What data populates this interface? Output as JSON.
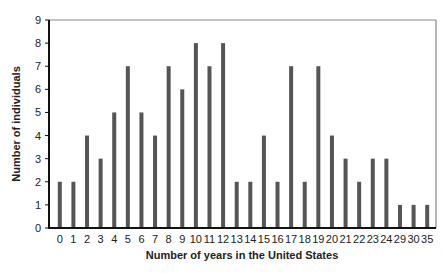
{
  "chart_data": {
    "type": "bar",
    "title": "",
    "xlabel": "Number of years in the United States",
    "ylabel": "Number of individuals",
    "categories": [
      "0",
      "1",
      "2",
      "3",
      "4",
      "5",
      "6",
      "7",
      "8",
      "9",
      "10",
      "11",
      "12",
      "13",
      "14",
      "15",
      "16",
      "17",
      "18",
      "19",
      "20",
      "21",
      "22",
      "23",
      "24",
      "29",
      "30",
      "35"
    ],
    "values": [
      2,
      2,
      4,
      3,
      5,
      7,
      5,
      4,
      7,
      6,
      8,
      7,
      8,
      2,
      2,
      4,
      2,
      7,
      2,
      7,
      4,
      3,
      2,
      3,
      3,
      1,
      1,
      1
    ],
    "ylim": [
      0,
      9
    ],
    "yticks": [
      0,
      1,
      2,
      3,
      4,
      5,
      6,
      7,
      8,
      9
    ],
    "grid": false,
    "legend": null,
    "bar_color": "#555555",
    "frame_color": "#888888"
  }
}
